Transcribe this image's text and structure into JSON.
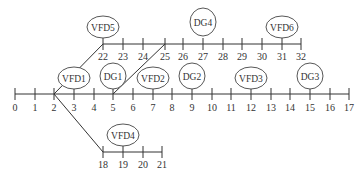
{
  "diagram": {
    "type": "bus network / feeder topology",
    "main_line": {
      "y": 94,
      "label_y": 111,
      "buses": [
        {
          "n": "0",
          "x": 15
        },
        {
          "n": "1",
          "x": 35
        },
        {
          "n": "2",
          "x": 54
        },
        {
          "n": "3",
          "x": 74
        },
        {
          "n": "4",
          "x": 94
        },
        {
          "n": "5",
          "x": 113
        },
        {
          "n": "6",
          "x": 133
        },
        {
          "n": "7",
          "x": 153
        },
        {
          "n": "8",
          "x": 172
        },
        {
          "n": "9",
          "x": 192
        },
        {
          "n": "10",
          "x": 212
        },
        {
          "n": "11",
          "x": 231
        },
        {
          "n": "12",
          "x": 251
        },
        {
          "n": "13",
          "x": 271
        },
        {
          "n": "14",
          "x": 290
        },
        {
          "n": "15",
          "x": 310
        },
        {
          "n": "16",
          "x": 330
        },
        {
          "n": "17",
          "x": 349
        }
      ]
    },
    "upper_line": {
      "y": 44,
      "label_y": 60,
      "buses": [
        {
          "n": "22",
          "x": 103
        },
        {
          "n": "23",
          "x": 123
        },
        {
          "n": "24",
          "x": 143
        },
        {
          "n": "25",
          "x": 165
        },
        {
          "n": "26",
          "x": 183
        },
        {
          "n": "27",
          "x": 203
        },
        {
          "n": "28",
          "x": 223
        },
        {
          "n": "29",
          "x": 242
        },
        {
          "n": "30",
          "x": 262
        },
        {
          "n": "31",
          "x": 282
        },
        {
          "n": "32",
          "x": 301
        }
      ]
    },
    "lower_line": {
      "y": 152,
      "label_y": 168,
      "buses": [
        {
          "n": "18",
          "x": 103
        },
        {
          "n": "19",
          "x": 123
        },
        {
          "n": "20",
          "x": 143
        },
        {
          "n": "21",
          "x": 162
        }
      ]
    },
    "branches": [
      {
        "from": "2",
        "to": "22",
        "x1": 54,
        "y1": 94,
        "x2": 103,
        "y2": 44
      },
      {
        "from": "5",
        "to": "25",
        "x1": 113,
        "y1": 94,
        "x2": 165,
        "y2": 44
      },
      {
        "from": "2",
        "to": "18",
        "x1": 54,
        "y1": 94,
        "x2": 103,
        "y2": 152
      }
    ],
    "nodes": [
      {
        "label": "VFD5",
        "bus": "22",
        "cx": 103,
        "cy": 27,
        "rx": 16,
        "ry": 11
      },
      {
        "label": "DG4",
        "bus": "27",
        "cx": 203,
        "cy": 22,
        "rx": 13,
        "ry": 14
      },
      {
        "label": "VFD6",
        "bus": "31",
        "cx": 282,
        "cy": 27,
        "rx": 16,
        "ry": 11
      },
      {
        "label": "VFD1",
        "bus": "3",
        "cx": 74,
        "cy": 78,
        "rx": 16,
        "ry": 11
      },
      {
        "label": "DG1",
        "bus": "5",
        "cx": 113,
        "cy": 76,
        "rx": 13,
        "ry": 13
      },
      {
        "label": "VFD2",
        "bus": "7",
        "cx": 153,
        "cy": 78,
        "rx": 16,
        "ry": 11
      },
      {
        "label": "DG2",
        "bus": "9",
        "cx": 192,
        "cy": 76,
        "rx": 13,
        "ry": 13
      },
      {
        "label": "VFD3",
        "bus": "12",
        "cx": 251,
        "cy": 78,
        "rx": 16,
        "ry": 11
      },
      {
        "label": "DG3",
        "bus": "15",
        "cx": 310,
        "cy": 76,
        "rx": 13,
        "ry": 13
      },
      {
        "label": "VFD4",
        "bus": "19",
        "cx": 123,
        "cy": 135,
        "rx": 16,
        "ry": 11
      }
    ]
  }
}
